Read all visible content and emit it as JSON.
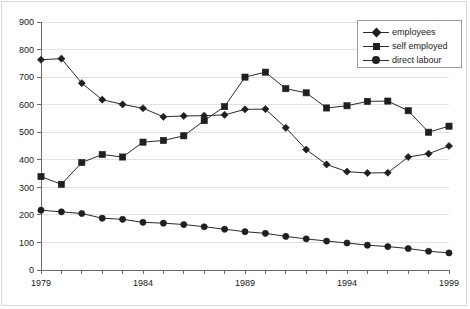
{
  "chart_data": {
    "type": "line",
    "title": "",
    "subtitle": "",
    "xlabel": "",
    "ylabel": "",
    "xlim": [
      1979,
      1999
    ],
    "ylim": [
      0,
      900
    ],
    "grid": true,
    "legend_position": "top-right",
    "yticks": [
      0,
      100,
      200,
      300,
      400,
      500,
      600,
      700,
      800,
      900
    ],
    "ytick_labels": [
      "0",
      "100",
      "200",
      "300",
      "400",
      "500",
      "600",
      "700",
      "800",
      "900"
    ],
    "x": [
      1979,
      1980,
      1981,
      1982,
      1983,
      1984,
      1985,
      1986,
      1987,
      1988,
      1989,
      1990,
      1991,
      1992,
      1993,
      1994,
      1995,
      1996,
      1997,
      1998,
      1999
    ],
    "xticks": [
      1979,
      1980,
      1981,
      1982,
      1983,
      1984,
      1985,
      1986,
      1987,
      1988,
      1989,
      1990,
      1991,
      1992,
      1993,
      1994,
      1995,
      1996,
      1997,
      1998,
      1999
    ],
    "xtick_labels": [
      "1979",
      "",
      "",
      "",
      "",
      "1984",
      "",
      "",
      "",
      "",
      "1989",
      "",
      "",
      "",
      "",
      "1994",
      "",
      "",
      "",
      "",
      "1999"
    ],
    "series": [
      {
        "name": "employees",
        "marker": "diamond",
        "color": "#1f1f1f",
        "values": [
          763,
          767,
          678,
          618,
          601,
          587,
          556,
          559,
          560,
          563,
          583,
          584,
          516,
          437,
          383,
          357,
          352,
          353,
          410,
          422,
          450
        ]
      },
      {
        "name": "self employed",
        "marker": "square",
        "color": "#1f1f1f",
        "values": [
          339,
          311,
          390,
          419,
          410,
          464,
          470,
          487,
          542,
          593,
          700,
          718,
          658,
          643,
          588,
          596,
          612,
          613,
          578,
          500,
          522
        ]
      },
      {
        "name": "direct labour",
        "marker": "circle",
        "color": "#1f1f1f",
        "values": [
          217,
          211,
          205,
          188,
          184,
          173,
          170,
          165,
          157,
          148,
          139,
          133,
          122,
          113,
          105,
          98,
          90,
          85,
          78,
          68,
          62
        ]
      }
    ]
  },
  "legend": {
    "items": [
      {
        "label": "employees",
        "marker": "diamond"
      },
      {
        "label": "self employed",
        "marker": "square"
      },
      {
        "label": "direct labour",
        "marker": "circle"
      }
    ]
  }
}
